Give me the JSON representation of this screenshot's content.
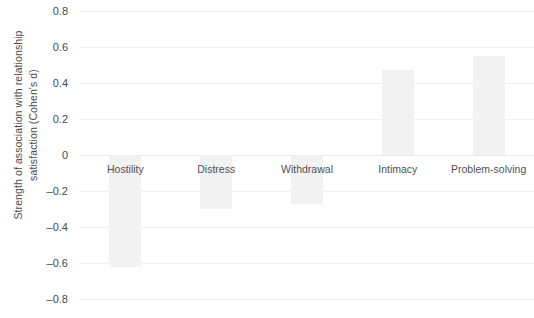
{
  "chart_data": {
    "type": "bar",
    "title": "",
    "subtitle": "",
    "xlabel": "",
    "ylabel": "Strength of association with relationship\nsatisfaction (Cohen's d)",
    "categories": [
      "Hostility",
      "Distress",
      "Withdrawal",
      "Intimacy",
      "Problem-solving"
    ],
    "values": [
      -0.62,
      -0.3,
      -0.27,
      0.47,
      0.55
    ],
    "ylim": [
      -0.8,
      0.8
    ],
    "yticks": [
      0.8,
      0.6,
      0.4,
      0.2,
      0,
      -0.2,
      -0.4,
      -0.6,
      -0.8
    ],
    "ytick_labels": [
      "0.8",
      "0.6",
      "0.4",
      "0.2",
      "0",
      "–0.2",
      "–0.4",
      "–0.6",
      "–0.8"
    ],
    "grid": true,
    "legend": false,
    "legend_position": "none",
    "bar_color": "#f2f2f2",
    "gridline_color": "#f0f0f0",
    "zero_line_color": "#e8e8e8",
    "text_color": "#4a4a4a"
  }
}
